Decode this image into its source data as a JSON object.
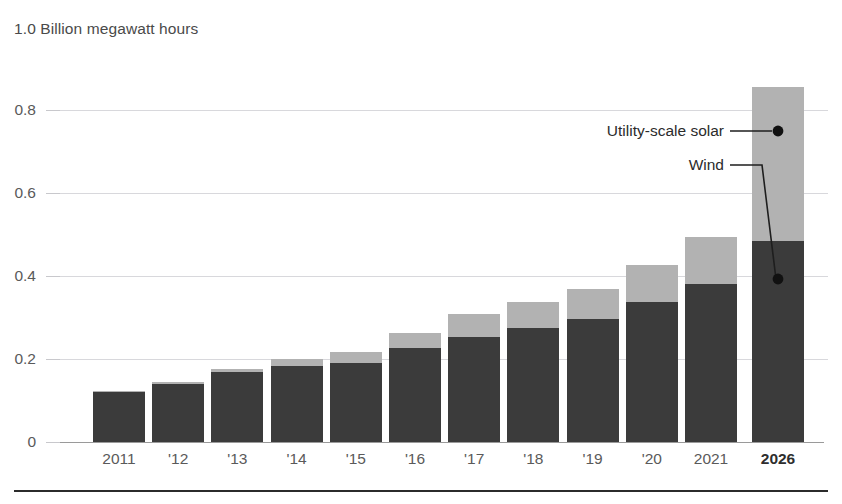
{
  "chart_data": {
    "type": "bar",
    "title": "1.0 Billion megawatt hours",
    "subtitle": "",
    "xlabel": "",
    "ylabel": "Billion megawatt hours",
    "stacked": true,
    "grid": true,
    "legend_position": "annotated-callouts",
    "ylim": [
      0,
      1.0
    ],
    "yticks": [
      0,
      0.2,
      0.4,
      0.6,
      0.8,
      1.0
    ],
    "ytick_labels": [
      "0",
      "0.2",
      "0.4",
      "0.6",
      "0.8",
      "1.0"
    ],
    "categories": [
      "2011",
      "'12",
      "'13",
      "'14",
      "'15",
      "'16",
      "'17",
      "'18",
      "'19",
      "'20",
      "2021",
      "2026"
    ],
    "series": [
      {
        "name": "Wind",
        "color": "#3b3b3b",
        "values": [
          0.122,
          0.141,
          0.168,
          0.182,
          0.191,
          0.227,
          0.254,
          0.275,
          0.296,
          0.338,
          0.38,
          0.485
        ]
      },
      {
        "name": "Utility-scale solar",
        "color": "#b2b2b2",
        "values": [
          0.002,
          0.004,
          0.009,
          0.018,
          0.025,
          0.036,
          0.054,
          0.063,
          0.072,
          0.088,
          0.115,
          0.37
        ]
      }
    ],
    "totals": [
      0.124,
      0.145,
      0.177,
      0.2,
      0.216,
      0.263,
      0.308,
      0.338,
      0.368,
      0.426,
      0.495,
      0.855
    ],
    "forecast_categories": [
      "2026"
    ],
    "annotations": [
      {
        "text": "Utility-scale solar",
        "series": "Utility-scale solar",
        "category": "2026",
        "point_value": 0.73
      },
      {
        "text": "Wind",
        "series": "Wind",
        "category": "2026",
        "point_value": 0.39
      }
    ]
  },
  "axis": {
    "title": "1.0 Billion megawatt hours"
  },
  "footer": {
    "rule": true
  }
}
